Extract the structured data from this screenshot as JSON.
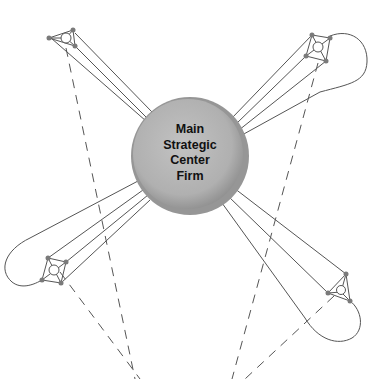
{
  "diagram": {
    "hub": {
      "lines": [
        "Main",
        "Strategic",
        "Center",
        "Firm"
      ],
      "fill_outer": "#9a9a9a",
      "fill_inner": "#b8b8b8"
    },
    "colors": {
      "line": "#555555",
      "node": "#7a7a7a",
      "dash": "#555555"
    },
    "partners": [
      {
        "id": "top-left",
        "position": "upper left",
        "shape": "triangle"
      },
      {
        "id": "top-right",
        "position": "upper right",
        "shape": "quadrilateral"
      },
      {
        "id": "bottom-left",
        "position": "lower left",
        "shape": "quadrilateral"
      },
      {
        "id": "bottom-right",
        "position": "lower right",
        "shape": "triangle"
      }
    ]
  }
}
